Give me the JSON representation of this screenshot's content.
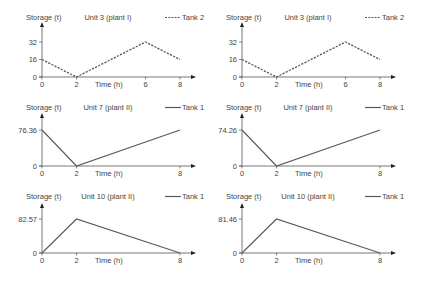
{
  "chart_data": [
    {
      "type": "line",
      "panel": "top-left",
      "title": "Unit 3 (plant I)",
      "xlabel": "Time (h)",
      "ylabel": "Storage (t)",
      "legend": [
        {
          "name": "Tank 2",
          "style": "dashed"
        }
      ],
      "x_ticks": [
        "0",
        "2",
        "6",
        "8"
      ],
      "y_ticks": [
        "0",
        "16",
        "32"
      ],
      "series": [
        {
          "name": "Tank 2",
          "style": "dashed",
          "x": [
            0,
            2,
            6,
            8
          ],
          "y": [
            16,
            0,
            32,
            16
          ]
        }
      ],
      "ylim": [
        0,
        32
      ],
      "xlim": [
        0,
        8
      ],
      "grid": false
    },
    {
      "type": "line",
      "panel": "top-right",
      "title": "Unit 3 (plant I)",
      "xlabel": "Time (h)",
      "ylabel": "Storage (t)",
      "legend": [
        {
          "name": "Tank 2",
          "style": "dashed"
        }
      ],
      "x_ticks": [
        "0",
        "2",
        "6",
        "8"
      ],
      "y_ticks": [
        "0",
        "16",
        "32"
      ],
      "series": [
        {
          "name": "Tank 2",
          "style": "dashed",
          "x": [
            0,
            2,
            6,
            8
          ],
          "y": [
            16,
            0,
            32,
            16
          ]
        }
      ],
      "ylim": [
        0,
        32
      ],
      "xlim": [
        0,
        8
      ],
      "grid": false
    },
    {
      "type": "line",
      "panel": "middle-left",
      "title": "Unit 7 (plant II)",
      "xlabel": "Time (h)",
      "ylabel": "Storage (t)",
      "legend": [
        {
          "name": "Tank 1",
          "style": "solid"
        }
      ],
      "x_ticks": [
        "0",
        "2",
        "8"
      ],
      "y_ticks": [
        "0",
        "76.36"
      ],
      "series": [
        {
          "name": "Tank 1",
          "style": "solid",
          "x": [
            0,
            2,
            8
          ],
          "y": [
            76.36,
            0,
            76.36
          ]
        }
      ],
      "ylim": [
        0,
        76.36
      ],
      "xlim": [
        0,
        8
      ],
      "grid": false
    },
    {
      "type": "line",
      "panel": "middle-right",
      "title": "Unit 7 (plant II)",
      "xlabel": "Time (h)",
      "ylabel": "Storage (t)",
      "legend": [
        {
          "name": "Tank 1",
          "style": "solid"
        }
      ],
      "x_ticks": [
        "0",
        "2",
        "8"
      ],
      "y_ticks": [
        "0",
        "74.26"
      ],
      "series": [
        {
          "name": "Tank 1",
          "style": "solid",
          "x": [
            0,
            2,
            8
          ],
          "y": [
            74.26,
            0,
            74.26
          ]
        }
      ],
      "ylim": [
        0,
        74.26
      ],
      "xlim": [
        0,
        8
      ],
      "grid": false
    },
    {
      "type": "line",
      "panel": "bottom-left",
      "title": "Unit 10 (plant II)",
      "xlabel": "Time (h)",
      "ylabel": "Storage (t)",
      "legend": [
        {
          "name": "Tank 1",
          "style": "solid"
        }
      ],
      "x_ticks": [
        "0",
        "2",
        "8"
      ],
      "y_ticks": [
        "0",
        "82.57"
      ],
      "series": [
        {
          "name": "Tank 1",
          "style": "solid",
          "x": [
            0,
            2,
            8
          ],
          "y": [
            0,
            82.57,
            0
          ]
        }
      ],
      "ylim": [
        0,
        82.57
      ],
      "xlim": [
        0,
        8
      ],
      "grid": false
    },
    {
      "type": "line",
      "panel": "bottom-right",
      "title": "Unit 10 (plant II)",
      "xlabel": "Time (h)",
      "ylabel": "Storage (t)",
      "legend": [
        {
          "name": "Tank 1",
          "style": "solid"
        }
      ],
      "x_ticks": [
        "0",
        "2",
        "8"
      ],
      "y_ticks": [
        "0",
        "81.46"
      ],
      "series": [
        {
          "name": "Tank 1",
          "style": "solid",
          "x": [
            0,
            2,
            8
          ],
          "y": [
            0,
            81.46,
            0
          ]
        }
      ],
      "ylim": [
        0,
        81.46
      ],
      "xlim": [
        0,
        8
      ],
      "grid": false
    }
  ],
  "colors": {
    "line": "#5a5a5a",
    "axis": "#555555",
    "text": "#444444"
  }
}
